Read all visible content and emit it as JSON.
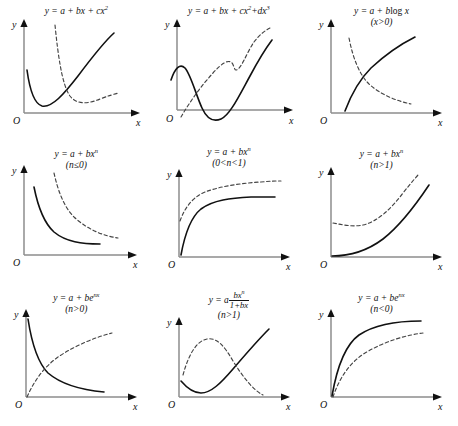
{
  "figure": {
    "background_color": "#ffffff",
    "axis_color": "#8d8d8d",
    "solid_curve_color": "#111111",
    "dashed_curve_color": "#444444",
    "rows": 3,
    "columns": 3,
    "axis_labels": {
      "x": "x",
      "y": "y",
      "origin": "O"
    }
  },
  "panels": [
    {
      "id": "panel-1",
      "equation_html": "y = a + bx + cx<sup>2</sup>",
      "equation_text": "y = a + bx + cx2",
      "condition": "",
      "curves": [
        {
          "style": "solid",
          "shape": "parabola-opening-up, vertex near left"
        },
        {
          "style": "dashed",
          "shape": "narrow parabola-opening-up, vertex right of solid"
        }
      ]
    },
    {
      "id": "panel-2",
      "equation_html": "y = a + bx + cx<sup>2</sup>+dx<sup>3</sup>",
      "equation_text": "y = a + bx + cx2+dx3",
      "condition": "",
      "curves": [
        {
          "style": "solid",
          "shape": "cubic with local max then min below axis, rising"
        },
        {
          "style": "dashed",
          "shape": "monotonic rising cubic with inflection"
        }
      ]
    },
    {
      "id": "panel-3",
      "equation_html": "y = a + b<span class=\"up\">log</span> x",
      "equation_text": "y = a + blog x",
      "condition": "(x>0)",
      "curves": [
        {
          "style": "solid",
          "shape": "logarithmic rising from x-axis"
        },
        {
          "style": "dashed",
          "shape": "decaying curve crossing the solid"
        }
      ]
    },
    {
      "id": "panel-4",
      "equation_html": "y = a + bx<sup>n</sup>",
      "equation_text": "y = a + bxn",
      "condition": "(n≤0)",
      "curves": [
        {
          "style": "solid",
          "shape": "decaying hyperbola flattening to asymptote"
        },
        {
          "style": "dashed",
          "shape": "decaying hyperbola offset up and right"
        }
      ]
    },
    {
      "id": "panel-5",
      "equation_html": "y = a + bx<sup>n</sup>",
      "equation_text": "y = a + bxn",
      "condition": "(0<n<1)",
      "curves": [
        {
          "style": "solid",
          "shape": "steep rise from origin then saturating plateau"
        },
        {
          "style": "dashed",
          "shape": "higher saturating curve above the solid"
        }
      ]
    },
    {
      "id": "panel-6",
      "equation_html": "y = a + bx<sup>n</sup>",
      "equation_text": "y = a + bxn",
      "condition": "(n>1)",
      "curves": [
        {
          "style": "solid",
          "shape": "power curve rising from origin, convex"
        },
        {
          "style": "dashed",
          "shape": "convex curve starting above zero with shallow dip"
        }
      ]
    },
    {
      "id": "panel-7",
      "equation_html": "y = a + be<sup>nx</sup>",
      "equation_text": "y = a + benx",
      "condition": "(n>0)",
      "curves": [
        {
          "style": "solid",
          "shape": "exponential decay from high y to asymptote"
        },
        {
          "style": "dashed",
          "shape": "rising saturating curve from origin"
        }
      ]
    },
    {
      "id": "panel-8",
      "equation_html": "y = a",
      "equation_text": "y = a bxn/(1+bx)",
      "fraction": {
        "numerator_html": "bx<sup>n</sup>",
        "denominator_html": "1+bx"
      },
      "condition": "(n>1)",
      "curves": [
        {
          "style": "solid",
          "shape": "dips to minimum then rises steeply"
        },
        {
          "style": "dashed",
          "shape": "hump rising to max then falling steeply"
        }
      ]
    },
    {
      "id": "panel-9",
      "equation_html": "y = a + be<sup>nx</sup>",
      "equation_text": "y = a + benx",
      "condition": "(n<0)",
      "curves": [
        {
          "style": "solid",
          "shape": "steep rise from origin saturating high"
        },
        {
          "style": "dashed",
          "shape": "slower rise saturating below the solid"
        }
      ]
    }
  ]
}
